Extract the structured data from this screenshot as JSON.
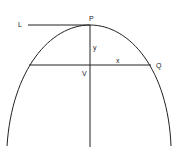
{
  "diagram": {
    "labels": {
      "L": "L",
      "P": "P",
      "y": "y",
      "V": "V",
      "x": "x",
      "Q": "Q"
    }
  }
}
